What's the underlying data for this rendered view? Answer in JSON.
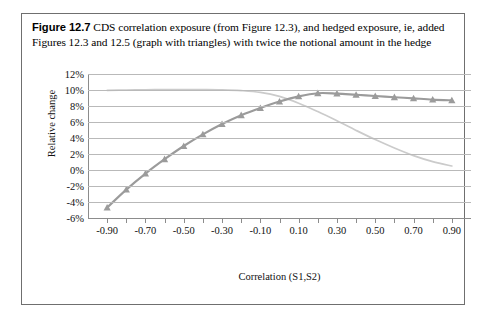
{
  "caption": {
    "figure_number": "Figure 12.7",
    "text": "CDS correlation exposure (from Figure 12.3), and hedged exposure, ie, added Figures 12.3 and 12.5 (graph with triangles) with twice the notional amount in the hedge"
  },
  "chart_data": {
    "type": "line",
    "title": "",
    "xlabel": "Correlation (S1,S2)",
    "ylabel": "Relative change",
    "xlim": [
      -1.0,
      1.0
    ],
    "ylim": [
      -6,
      12
    ],
    "grid": true,
    "legend_position": "none",
    "y_ticks": [
      12,
      10,
      8,
      6,
      4,
      2,
      0,
      -2,
      -4,
      -6
    ],
    "y_tick_labels": [
      "12%",
      "10%",
      "8%",
      "6%",
      "4%",
      "2%",
      "0%",
      "-2%",
      "-4%",
      "-6%"
    ],
    "x_ticks": [
      -0.9,
      -0.8,
      -0.7,
      -0.6,
      -0.5,
      -0.4,
      -0.3,
      -0.2,
      -0.1,
      0.0,
      0.1,
      0.2,
      0.3,
      0.4,
      0.5,
      0.6,
      0.7,
      0.8,
      0.9
    ],
    "x_tick_labels": [
      "-0.90",
      "-0.70",
      "-0.50",
      "-0.30",
      "-0.10",
      "0.10",
      "0.30",
      "0.50",
      "0.70",
      "0.90"
    ],
    "x_labeled_ticks": [
      -0.9,
      -0.7,
      -0.5,
      -0.3,
      -0.1,
      0.1,
      0.3,
      0.5,
      0.7,
      0.9
    ],
    "x": [
      -0.9,
      -0.8,
      -0.7,
      -0.6,
      -0.5,
      -0.4,
      -0.3,
      -0.2,
      -0.1,
      0.0,
      0.1,
      0.2,
      0.3,
      0.4,
      0.5,
      0.6,
      0.7,
      0.8,
      0.9
    ],
    "series": [
      {
        "name": "CDS correlation exposure",
        "color": "#cbcbcb",
        "marker": "none",
        "values": [
          9.95,
          10.0,
          10.03,
          10.05,
          10.06,
          10.05,
          10.02,
          9.92,
          9.7,
          9.2,
          8.35,
          7.3,
          6.15,
          4.95,
          3.8,
          2.75,
          1.8,
          1.05,
          0.5
        ]
      },
      {
        "name": "Hedged exposure (with triangles)",
        "color": "#9b9b9b",
        "marker": "triangle",
        "values": [
          -4.7,
          -2.45,
          -0.45,
          1.35,
          3.0,
          4.45,
          5.75,
          6.85,
          7.75,
          8.55,
          9.2,
          9.6,
          9.55,
          9.4,
          9.25,
          9.1,
          8.95,
          8.8,
          8.7
        ]
      }
    ]
  }
}
